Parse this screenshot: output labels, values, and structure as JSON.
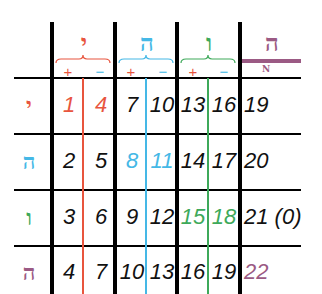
{
  "colors": {
    "red": "#e8553e",
    "blue": "#45b8e6",
    "green": "#3ea95a",
    "purple": "#9b5a84",
    "black": "#111111"
  },
  "columns": [
    {
      "letter": "י",
      "color": "red",
      "plus": "+",
      "minus": "−"
    },
    {
      "letter": "ה",
      "color": "blue",
      "plus": "+",
      "minus": "−"
    },
    {
      "letter": "ו",
      "color": "green",
      "plus": "+",
      "minus": "−"
    },
    {
      "letter": "ה",
      "color": "purple",
      "sublabel": "N"
    }
  ],
  "rows": [
    {
      "letter": "י",
      "color": "red",
      "values": [
        "1",
        "4",
        "7",
        "10",
        "13",
        "16",
        "19"
      ],
      "value_colors": [
        "red",
        "red",
        "black",
        "black",
        "black",
        "black",
        "black"
      ]
    },
    {
      "letter": "ה",
      "color": "blue",
      "values": [
        "2",
        "5",
        "8",
        "11",
        "14",
        "17",
        "20"
      ],
      "value_colors": [
        "black",
        "black",
        "blue",
        "blue",
        "black",
        "black",
        "black"
      ]
    },
    {
      "letter": "ו",
      "color": "green",
      "values": [
        "3",
        "6",
        "9",
        "12",
        "15",
        "18",
        "21 (0)"
      ],
      "value_colors": [
        "black",
        "black",
        "black",
        "black",
        "green",
        "green",
        "black"
      ]
    },
    {
      "letter": "ה",
      "color": "purple",
      "values": [
        "4",
        "7",
        "10",
        "13",
        "16",
        "19",
        "22"
      ],
      "value_colors": [
        "black",
        "black",
        "black",
        "black",
        "black",
        "black",
        "purple"
      ]
    }
  ]
}
